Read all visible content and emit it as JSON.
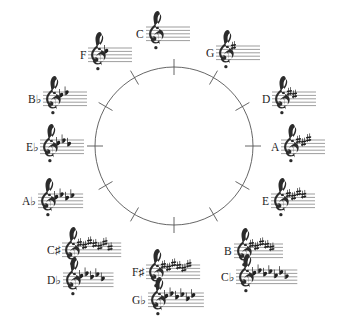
{
  "diagram": {
    "type": "circle-of-fifths",
    "background_color": "#ffffff",
    "line_color": "#555555",
    "text_color": "#1c1c1c",
    "circle": {
      "center_x": 174,
      "center_y": 146,
      "radius": 79,
      "tick_count": 12
    },
    "nodes": [
      {
        "id": "c",
        "label": "C",
        "label_plain": "C",
        "accidental": "",
        "clef": "treble-clef",
        "accidental_type": "none",
        "accidental_count": 0,
        "position": "12-oclock",
        "x": 136,
        "y": 15,
        "align": "left"
      },
      {
        "id": "g",
        "label": "G",
        "label_plain": "G",
        "accidental": "",
        "clef": "treble-clef",
        "accidental_type": "sharp",
        "accidental_count": 1,
        "position": "1-oclock",
        "x": 206,
        "y": 34,
        "align": "left"
      },
      {
        "id": "d",
        "label": "D",
        "label_plain": "D",
        "accidental": "",
        "clef": "treble-clef",
        "accidental_type": "sharp",
        "accidental_count": 2,
        "position": "2-oclock",
        "x": 262,
        "y": 80,
        "align": "left"
      },
      {
        "id": "a",
        "label": "A",
        "label_plain": "A",
        "accidental": "",
        "clef": "treble-clef",
        "accidental_type": "sharp",
        "accidental_count": 3,
        "position": "3-oclock",
        "x": 271,
        "y": 128,
        "align": "left"
      },
      {
        "id": "e",
        "label": "E",
        "label_plain": "E",
        "accidental": "",
        "clef": "treble-clef",
        "accidental_type": "sharp",
        "accidental_count": 4,
        "position": "4-oclock",
        "x": 262,
        "y": 182,
        "align": "left"
      },
      {
        "id": "b",
        "label": "B",
        "label_plain": "B",
        "accidental": "",
        "clef": "treble-clef",
        "accidental_type": "sharp",
        "accidental_count": 5,
        "position": "5-oclock",
        "x": 224,
        "y": 232,
        "align": "left"
      },
      {
        "id": "cb",
        "label": "C♭",
        "label_plain": "Cb",
        "accidental": "♭",
        "clef": "treble-clef",
        "accidental_type": "flat",
        "accidental_count": 7,
        "position": "5-oclock-enharmonic",
        "x": 221,
        "y": 258,
        "align": "left"
      },
      {
        "id": "fsharp",
        "label": "F♯",
        "label_plain": "F#",
        "accidental": "♯",
        "clef": "treble-clef",
        "accidental_type": "sharp",
        "accidental_count": 6,
        "position": "6-oclock",
        "x": 132,
        "y": 253,
        "align": "left"
      },
      {
        "id": "gb",
        "label": "G♭",
        "label_plain": "Gb",
        "accidental": "♭",
        "clef": "treble-clef",
        "accidental_type": "flat",
        "accidental_count": 6,
        "position": "6-oclock-enharmonic",
        "x": 132,
        "y": 281,
        "align": "left"
      },
      {
        "id": "csharp",
        "label": "C♯",
        "label_plain": "C#",
        "accidental": "♯",
        "clef": "treble-clef",
        "accidental_type": "sharp",
        "accidental_count": 7,
        "position": "7-oclock",
        "x": 47,
        "y": 231,
        "align": "left"
      },
      {
        "id": "db",
        "label": "D♭",
        "label_plain": "Db",
        "accidental": "♭",
        "clef": "treble-clef",
        "accidental_type": "flat",
        "accidental_count": 5,
        "position": "7-oclock-enharmonic",
        "x": 47,
        "y": 261,
        "align": "left"
      },
      {
        "id": "ab",
        "label": "A♭",
        "label_plain": "Ab",
        "accidental": "♭",
        "clef": "treble-clef",
        "accidental_type": "flat",
        "accidental_count": 4,
        "position": "8-oclock",
        "x": 22,
        "y": 182,
        "align": "left"
      },
      {
        "id": "eb",
        "label": "E♭",
        "label_plain": "Eb",
        "accidental": "♭",
        "clef": "treble-clef",
        "accidental_type": "flat",
        "accidental_count": 3,
        "position": "9-oclock",
        "x": 26,
        "y": 128,
        "align": "left"
      },
      {
        "id": "bb",
        "label": "B♭",
        "label_plain": "Bb",
        "accidental": "♭",
        "clef": "treble-clef",
        "accidental_type": "flat",
        "accidental_count": 2,
        "position": "10-oclock",
        "x": 28,
        "y": 80,
        "align": "left"
      },
      {
        "id": "f",
        "label": "F",
        "label_plain": "F",
        "accidental": "",
        "clef": "treble-clef",
        "accidental_type": "none",
        "accidental_count": 1,
        "accidental_type_real": "flat",
        "position": "11-oclock",
        "x": 80,
        "y": 36,
        "align": "left"
      }
    ]
  }
}
